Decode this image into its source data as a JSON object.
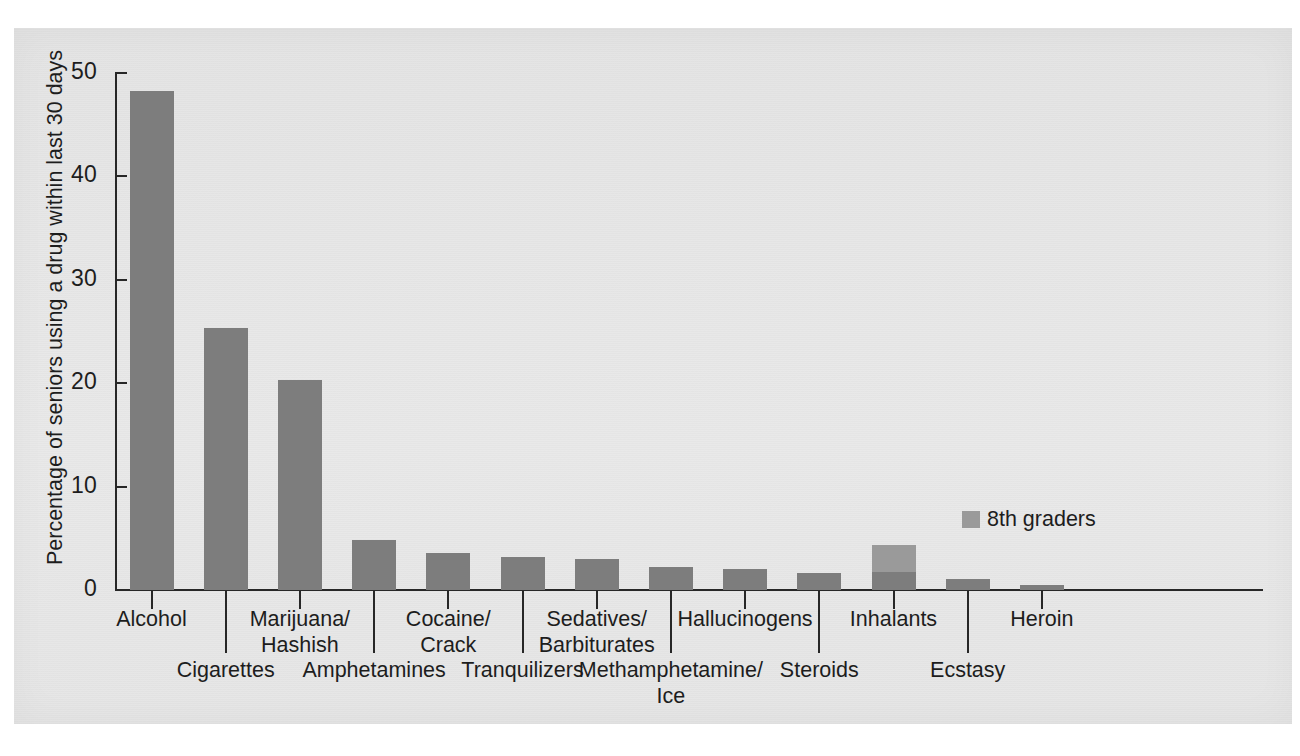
{
  "chart_data": {
    "type": "bar",
    "title": "",
    "subtitle": "",
    "xlabel": "",
    "ylabel": "Percentage of seniors using a drug within last 30 days",
    "ylim": [
      0,
      50
    ],
    "yticks": [
      0,
      10,
      20,
      30,
      40,
      50
    ],
    "grid": false,
    "legend_position": "inside-right",
    "legend": [
      {
        "name": "8th graders",
        "color": "#9a9a9a"
      }
    ],
    "categories": [
      "Alcohol",
      "Cigarettes",
      "Marijuana/\nHashish",
      "Amphetamines",
      "Cocaine/\nCrack",
      "Tranquilizers",
      "Sedatives/\nBarbiturates",
      "Methamphetamine/\nIce",
      "Hallucinogens",
      "Steroids",
      "Inhalants",
      "Ecstasy",
      "Heroin"
    ],
    "series": [
      {
        "name": "Seniors",
        "color": "#7d7d7d",
        "values": [
          48.3,
          25.3,
          20.3,
          4.8,
          3.6,
          3.2,
          3.0,
          2.2,
          2.0,
          1.6,
          1.7,
          1.1,
          0.5
        ]
      },
      {
        "name": "8th graders",
        "color": "#9a9a9a",
        "values": [
          null,
          null,
          null,
          null,
          null,
          null,
          null,
          null,
          null,
          null,
          4.4,
          null,
          null
        ]
      }
    ]
  },
  "axis": {
    "y_tick_labels": [
      "50",
      "40",
      "30",
      "20",
      "10",
      "0"
    ]
  },
  "x_labels": {
    "row_top": [
      {
        "text": "Alcohol",
        "index": 0
      },
      {
        "text": "Marijuana/",
        "text2": "Hashish",
        "index": 2
      },
      {
        "text": "Cocaine/",
        "text2": "Crack",
        "index": 4
      },
      {
        "text": "Sedatives/",
        "text2": "Barbiturates",
        "index": 6
      },
      {
        "text": "Hallucinogens",
        "index": 8
      },
      {
        "text": "Inhalants",
        "index": 10
      },
      {
        "text": "Heroin",
        "index": 12
      }
    ],
    "row_bottom": [
      {
        "text": "Cigarettes",
        "index": 1
      },
      {
        "text": "Amphetamines",
        "index": 3
      },
      {
        "text": "Tranquilizers",
        "index": 5
      },
      {
        "text": "Methamphetamine/",
        "text2": "Ice",
        "index": 7
      },
      {
        "text": "Steroids",
        "index": 9
      },
      {
        "text": "Ecstasy",
        "index": 11
      }
    ]
  },
  "legend_label": "8th graders"
}
